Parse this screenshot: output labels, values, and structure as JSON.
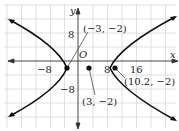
{
  "diagram": {
    "type": "hyperbola-graph",
    "axes": {
      "x_label": "x",
      "y_label": "y",
      "origin_label": "O"
    },
    "ticks": {
      "x": [
        "−8",
        "8",
        "16"
      ],
      "y": [
        "8",
        "−8"
      ]
    },
    "points": [
      {
        "label": "(−3, −2)",
        "x": -3,
        "y": -2,
        "role": "vertex"
      },
      {
        "label": "(3, −2)",
        "x": 3,
        "y": -2,
        "role": "center"
      },
      {
        "label": "(10.2, −2)",
        "x": 10.2,
        "y": -2,
        "role": "focus"
      }
    ],
    "colors": {
      "grid": "#d8d8d8",
      "axis": "#333333",
      "curve": "#111111"
    }
  }
}
